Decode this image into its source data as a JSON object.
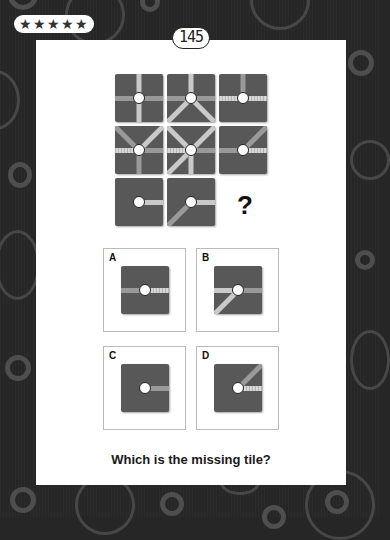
{
  "header": {
    "stars": "★★★★★",
    "star_count": 5,
    "page_number": "145"
  },
  "puzzle": {
    "grid": [
      {
        "row": 1,
        "col": 1,
        "lines": [
          {
            "dir": "N",
            "shade": "light"
          },
          {
            "dir": "S",
            "shade": "light"
          },
          {
            "dir": "E",
            "shade": "mid"
          },
          {
            "dir": "W",
            "shade": "mid"
          }
        ]
      },
      {
        "row": 1,
        "col": 2,
        "lines": [
          {
            "dir": "N",
            "shade": "light"
          },
          {
            "dir": "E",
            "shade": "mid"
          },
          {
            "dir": "W",
            "shade": "mid"
          },
          {
            "dir": "SW",
            "shade": "light"
          },
          {
            "dir": "SE",
            "shade": "light"
          }
        ]
      },
      {
        "row": 1,
        "col": 3,
        "lines": [
          {
            "dir": "N",
            "shade": "mid"
          },
          {
            "dir": "E",
            "shade": "dashed"
          },
          {
            "dir": "W",
            "shade": "dashed"
          }
        ]
      },
      {
        "row": 2,
        "col": 1,
        "lines": [
          {
            "dir": "NW",
            "shade": "mid"
          },
          {
            "dir": "NE",
            "shade": "light"
          },
          {
            "dir": "E",
            "shade": "mid"
          },
          {
            "dir": "W",
            "shade": "dashed"
          },
          {
            "dir": "S",
            "shade": "mid"
          }
        ]
      },
      {
        "row": 2,
        "col": 2,
        "lines": [
          {
            "dir": "NW",
            "shade": "light"
          },
          {
            "dir": "NE",
            "shade": "light"
          },
          {
            "dir": "E",
            "shade": "mid"
          },
          {
            "dir": "W",
            "shade": "dashed"
          },
          {
            "dir": "S",
            "shade": "light"
          },
          {
            "dir": "SW",
            "shade": "light"
          }
        ]
      },
      {
        "row": 2,
        "col": 3,
        "lines": [
          {
            "dir": "NE",
            "shade": "mid"
          },
          {
            "dir": "E",
            "shade": "dashed"
          },
          {
            "dir": "W",
            "shade": "mid"
          }
        ]
      },
      {
        "row": 3,
        "col": 1,
        "lines": [
          {
            "dir": "E",
            "shade": "light"
          }
        ]
      },
      {
        "row": 3,
        "col": 2,
        "lines": [
          {
            "dir": "E",
            "shade": "light"
          },
          {
            "dir": "SW",
            "shade": "mid"
          }
        ]
      }
    ],
    "missing_marker": "?",
    "answers": [
      {
        "label": "A",
        "lines": [
          {
            "dir": "W",
            "shade": "mid"
          },
          {
            "dir": "E",
            "shade": "dashed"
          }
        ]
      },
      {
        "label": "B",
        "lines": [
          {
            "dir": "W",
            "shade": "light"
          },
          {
            "dir": "E",
            "shade": "mid"
          },
          {
            "dir": "SW",
            "shade": "light"
          }
        ]
      },
      {
        "label": "C",
        "lines": [
          {
            "dir": "E",
            "shade": "mid"
          }
        ]
      },
      {
        "label": "D",
        "lines": [
          {
            "dir": "NE",
            "shade": "mid"
          },
          {
            "dir": "E",
            "shade": "dashed"
          }
        ]
      }
    ],
    "prompt": "Which is the missing tile?"
  },
  "colors": {
    "background": "#262626",
    "swirl": "#4e4e4e",
    "card": "#ffffff",
    "tile": "#585858",
    "line_light": "#c9c9c9",
    "line_mid": "#999999"
  }
}
